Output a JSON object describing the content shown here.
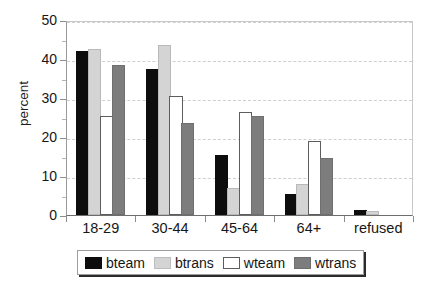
{
  "chart_data": {
    "type": "bar",
    "title": "",
    "xlabel": "",
    "ylabel": "percent",
    "ylim": [
      0,
      50
    ],
    "yticks": [
      0,
      10,
      20,
      30,
      40,
      50
    ],
    "ytick_labels": [
      "0",
      "10",
      "20",
      "30",
      "40",
      "50"
    ],
    "minor_tick_step": 5,
    "grid": true,
    "grid_axis": "y",
    "legend_position": "bottom",
    "categories": [
      "18-29",
      "30-44",
      "45-64",
      "64+",
      "refused"
    ],
    "series": [
      {
        "name": "bteam",
        "color": "#0d0d0d",
        "values": [
          41.5,
          37.0,
          15.0,
          5.0,
          0.7
        ]
      },
      {
        "name": "btrans",
        "color": "#d4d4d4",
        "values": [
          42.0,
          43.0,
          6.5,
          7.5,
          0.3
        ]
      },
      {
        "name": "wteam",
        "color": "#ffffff",
        "values": [
          25.0,
          30.0,
          26.0,
          18.5,
          0.0
        ]
      },
      {
        "name": "wtrans",
        "color": "#7d7d7d",
        "values": [
          38.0,
          23.0,
          25.0,
          14.0,
          0.0
        ]
      }
    ]
  },
  "axes": {
    "y_title": "percent"
  },
  "legend": {
    "entries": [
      {
        "label": "bteam"
      },
      {
        "label": "btrans"
      },
      {
        "label": "wteam"
      },
      {
        "label": "wtrans"
      }
    ]
  },
  "caption_strip": {
    "left_fragment": "",
    "right_fragment": ""
  }
}
